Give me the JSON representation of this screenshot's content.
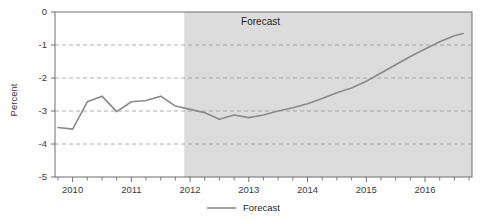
{
  "chart_data": {
    "type": "line",
    "title": "",
    "xlabel": "",
    "ylabel": "Percent",
    "ylim": [
      -5,
      0
    ],
    "xlim": [
      2009.7,
      2016.8
    ],
    "grid": true,
    "gridlines_y": [
      -1,
      -2,
      -3,
      -4
    ],
    "ytick_labels": [
      "0",
      "-1",
      "-2",
      "-3",
      "-4",
      "-5"
    ],
    "ytick_values": [
      0,
      -1,
      -2,
      -3,
      -4,
      -5
    ],
    "xtick_labels": [
      "2010",
      "2011",
      "2012",
      "2013",
      "2014",
      "2015",
      "2016"
    ],
    "xtick_values": [
      2010,
      2011,
      2012,
      2013,
      2014,
      2015,
      2016
    ],
    "minor_xtick_interval": 0.25,
    "legend_position": "bottom-center",
    "annotations": [
      {
        "text": "Forecast",
        "x": 2013.2,
        "y": -0.38
      }
    ],
    "shaded_region": {
      "label": "Forecast",
      "x_start": 2011.9,
      "x_end": 2016.8,
      "color": "#dcdcdc"
    },
    "series": [
      {
        "name": "Forecast",
        "color": "#8a8a8a",
        "x": [
          2009.75,
          2010.0,
          2010.25,
          2010.5,
          2010.75,
          2011.0,
          2011.25,
          2011.5,
          2011.75,
          2012.0,
          2012.25,
          2012.5,
          2012.75,
          2013.0,
          2013.25,
          2013.5,
          2013.75,
          2014.0,
          2014.25,
          2014.5,
          2014.75,
          2015.0,
          2015.25,
          2015.5,
          2015.75,
          2016.0,
          2016.25,
          2016.5,
          2016.65
        ],
        "values": [
          -3.5,
          -3.55,
          -2.72,
          -2.55,
          -3.02,
          -2.72,
          -2.68,
          -2.55,
          -2.85,
          -2.95,
          -3.05,
          -3.25,
          -3.12,
          -3.2,
          -3.12,
          -3.0,
          -2.9,
          -2.78,
          -2.62,
          -2.45,
          -2.3,
          -2.1,
          -1.85,
          -1.6,
          -1.35,
          -1.12,
          -0.9,
          -0.72,
          -0.65
        ]
      }
    ]
  },
  "legend": {
    "entries": [
      {
        "label": "Forecast",
        "color": "#8a8a8a"
      }
    ]
  }
}
